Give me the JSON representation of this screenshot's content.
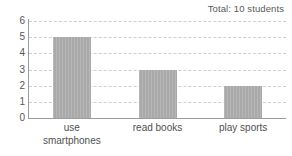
{
  "chart_data": {
    "type": "bar",
    "title": "",
    "annotation": "Total: 10 students",
    "categories": [
      "use\nsmartphones",
      "read books",
      "play sports"
    ],
    "category_labels_flat": [
      "use smartphones",
      "read books",
      "play sports"
    ],
    "values": [
      5,
      3,
      2
    ],
    "xlabel": "",
    "ylabel": "",
    "ylim": [
      0,
      6
    ],
    "y_ticks": [
      0,
      1,
      2,
      3,
      4,
      5,
      6
    ],
    "y_tick_labels": [
      "0",
      "1",
      "2",
      "3",
      "4",
      "5",
      "6"
    ],
    "grid": true,
    "grid_style": "dashed-horizontal",
    "legend": false,
    "bar_color": "#a9a9a9",
    "axis_color": "#9b9b9b",
    "gridline_color": "#cfcfcf",
    "background_color": "#ffffff"
  }
}
